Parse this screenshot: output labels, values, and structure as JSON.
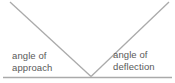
{
  "diagram": {
    "left_label": {
      "line1": "angle of",
      "line2": "approach"
    },
    "right_label": {
      "line1": "angle of",
      "line2": "deflection"
    }
  },
  "colors": {
    "line": "#aaaaaa",
    "text": "#595959",
    "background": "#ffffff"
  }
}
